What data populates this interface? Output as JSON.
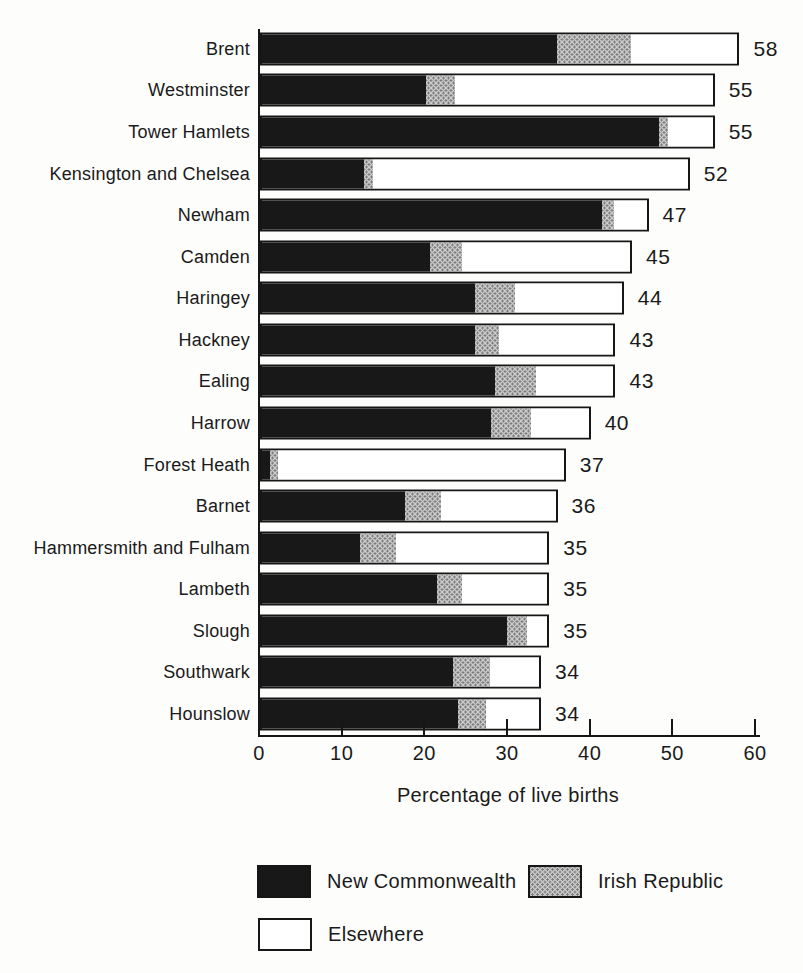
{
  "chart_data": {
    "type": "bar",
    "orientation": "horizontal",
    "stacked": true,
    "title": "",
    "xlabel": "Percentage of live births",
    "xlim": [
      0,
      60
    ],
    "xticks": [
      0,
      10,
      20,
      30,
      40,
      50,
      60
    ],
    "grid": false,
    "legend_position": "bottom",
    "categories": [
      "Brent",
      "Westminster",
      "Tower Hamlets",
      "Kensington and Chelsea",
      "Newham",
      "Camden",
      "Haringey",
      "Hackney",
      "Ealing",
      "Harrow",
      "Forest Heath",
      "Barnet",
      "Hammersmith and Fulham",
      "Lambeth",
      "Slough",
      "Southwark",
      "Hounslow"
    ],
    "totals": [
      58,
      55,
      55,
      52,
      47,
      45,
      44,
      43,
      43,
      40,
      37,
      36,
      35,
      35,
      35,
      34,
      34
    ],
    "series": [
      {
        "name": "New Commonwealth",
        "values": [
          36,
          20,
          48.5,
          12.5,
          41.5,
          20.5,
          26,
          26,
          28.5,
          28,
          1,
          17.5,
          12,
          21.5,
          30,
          23.5,
          24
        ]
      },
      {
        "name": "Irish Republic",
        "values": [
          9,
          3.5,
          1,
          1,
          1.5,
          4,
          5,
          3,
          5,
          5,
          1,
          4.5,
          4.5,
          3,
          2.5,
          4.5,
          3.5
        ]
      },
      {
        "name": "Elsewhere",
        "values": [
          13,
          31.5,
          5.5,
          38.5,
          4,
          20.5,
          13,
          14,
          9.5,
          7,
          35,
          14,
          18.5,
          10.5,
          2.5,
          6,
          6.5
        ]
      }
    ]
  },
  "legend": {
    "items": [
      {
        "label": "New Commonwealth",
        "color": "#181818",
        "style": "solid-black"
      },
      {
        "label": "Irish Republic",
        "color": "#9a9a9a",
        "style": "halftone-gray"
      },
      {
        "label": "Elsewhere",
        "color": "#ffffff",
        "style": "white-outlined"
      }
    ]
  },
  "colors": {
    "ink": "#161616",
    "background": "#fdfdfc",
    "bar_black": "#181818",
    "bar_gray": "#a9a9a9",
    "bar_white": "#ffffff"
  }
}
